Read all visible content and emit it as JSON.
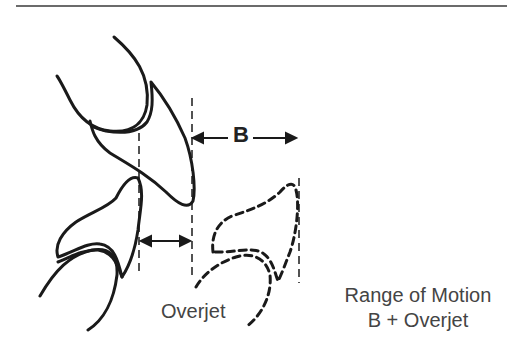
{
  "figure": {
    "type": "dental-occlusion-diagram",
    "labels": {
      "b_distance": "B",
      "overjet": "Overjet",
      "range_line1": "Range of Motion",
      "range_line2": "B + Overjet"
    },
    "colors": {
      "stroke": "#1a1a1a",
      "text": "#444444",
      "rule": "#6b6b6b"
    }
  }
}
